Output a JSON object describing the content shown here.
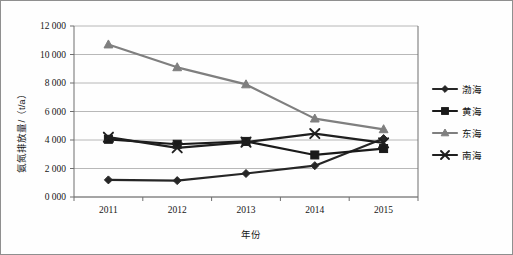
{
  "chart_data": {
    "type": "line",
    "title": "",
    "xlabel": "年份",
    "ylabel": "氨氮排放量/（t/a）",
    "categories": [
      "2011",
      "2012",
      "2013",
      "2014",
      "2015"
    ],
    "x": [
      2011,
      2012,
      2013,
      2014,
      2015
    ],
    "ylim": [
      0,
      12000
    ],
    "ytick_step": 2000,
    "ytick_labels": [
      "0 000",
      "2 000",
      "4 000",
      "6 000",
      "8 000",
      "10 000",
      "12 000"
    ],
    "ytick_values": [
      0,
      2000,
      4000,
      6000,
      8000,
      10000,
      12000
    ],
    "grid": true,
    "legend_position": "right",
    "series": [
      {
        "name": "渤海",
        "values": [
          1200,
          1150,
          1650,
          2200,
          4100
        ],
        "color": "#262626",
        "marker": "diamond"
      },
      {
        "name": "黄海",
        "values": [
          4050,
          3700,
          3900,
          2950,
          3400
        ],
        "color": "#1a1a1a",
        "marker": "square"
      },
      {
        "name": "东海",
        "values": [
          10700,
          9100,
          7900,
          5500,
          4750
        ],
        "color": "#7f7f7f",
        "marker": "triangle"
      },
      {
        "name": "南海",
        "values": [
          4200,
          3450,
          3850,
          4450,
          3800
        ],
        "color": "#1f1f1f",
        "marker": "cross"
      }
    ]
  },
  "colors": {
    "gridline": "#a6a6a6",
    "axis": "#6f6f6f",
    "border": "#8f8f8f",
    "text": "#161616",
    "background": "#ffffff"
  }
}
